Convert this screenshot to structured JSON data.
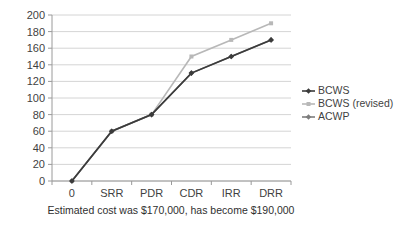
{
  "chart_data": {
    "type": "line",
    "title": "",
    "subtitle": "",
    "xlabel": "Estimated cost was $170,000, has become $190,000",
    "ylabel": "",
    "categories": [
      "0",
      "SRR",
      "PDR",
      "CDR",
      "IRR",
      "DRR"
    ],
    "ylim": [
      0,
      200
    ],
    "yticks": [
      "0",
      "20",
      "40",
      "60",
      "80",
      "100",
      "120",
      "140",
      "160",
      "180",
      "200"
    ],
    "ytick_values": [
      0,
      20,
      40,
      60,
      80,
      100,
      120,
      140,
      160,
      180,
      200
    ],
    "grid": true,
    "legend_position": "right",
    "series": [
      {
        "name": "BCWS",
        "values": [
          0,
          60,
          80,
          130,
          150,
          170
        ],
        "color": "#3b3b3b",
        "marker": "diamond"
      },
      {
        "name": "BCWS (revised)",
        "values": [
          0,
          60,
          80,
          150,
          170,
          190
        ],
        "color": "#b8b8b8",
        "marker": "square"
      },
      {
        "name": "ACWP",
        "values": [
          0,
          60,
          80,
          130,
          150,
          170
        ],
        "color": "#7d7d7d",
        "marker": "diamond"
      }
    ]
  },
  "legend": {
    "items": [
      {
        "label": "BCWS",
        "color": "#3b3b3b",
        "marker": "diamond"
      },
      {
        "label": "BCWS (revised)",
        "color": "#b8b8b8",
        "marker": "square"
      },
      {
        "label": "ACWP",
        "color": "#7d7d7d",
        "marker": "diamond"
      }
    ]
  },
  "colors": {
    "background": "#ffffff",
    "gridline": "#c9c9c9",
    "axis": "#9a9a9a",
    "text": "#3f3f3f"
  }
}
